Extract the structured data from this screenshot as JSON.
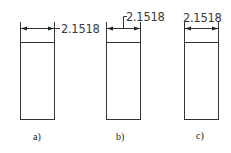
{
  "figure": {
    "panels": [
      {
        "id": "a",
        "dimension_value": "2.1518",
        "label": "a)",
        "text_placement": "right of dimension line"
      },
      {
        "id": "b",
        "dimension_value": "2.1518",
        "label": "b)",
        "text_placement": "above right with leader"
      },
      {
        "id": "c",
        "dimension_value": "2.1518",
        "label": "c)",
        "text_placement": "centered above dimension line"
      }
    ],
    "colors": {
      "line": "#333333",
      "text": "#3a3a3a",
      "background": "#ffffff"
    }
  }
}
